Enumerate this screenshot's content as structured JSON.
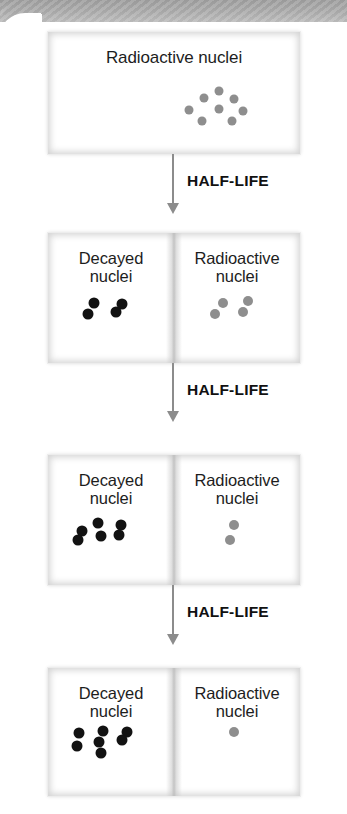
{
  "figure": {
    "colors": {
      "radioactive_nucleus": "#8e8e8e",
      "decayed_nucleus": "#121212",
      "arrow": "#8c8c8c",
      "top_band": "#a8a8a8",
      "label_text": "#1d1d1d"
    }
  },
  "labels": {
    "radioactive": "Radioactive nuclei",
    "radioactive_wrapped": "Radioactive\nnuclei",
    "decayed_wrapped": "Decayed\nnuclei",
    "half_life": "HALF-LIFE"
  },
  "stages": [
    {
      "id": "stage-0",
      "name": "initial-sample",
      "panels": [
        {
          "kind": "radioactive",
          "label": "Radioactive nuclei",
          "count": 8,
          "dot_color": "#8e8e8e",
          "dots": [
            {
              "x": 47,
              "y": 14
            },
            {
              "x": 31,
              "y": 24
            },
            {
              "x": 63,
              "y": 25
            },
            {
              "x": 16,
              "y": 40
            },
            {
              "x": 47,
              "y": 39
            },
            {
              "x": 72,
              "y": 41
            },
            {
              "x": 29,
              "y": 55
            },
            {
              "x": 60,
              "y": 55
            }
          ]
        }
      ]
    },
    {
      "id": "stage-1",
      "name": "after-one-half-life",
      "half_lives_elapsed": 1,
      "panels": [
        {
          "kind": "decayed",
          "label": "Decayed\nnuclei",
          "count": 4,
          "dot_color": "#121212",
          "dots": [
            {
              "x": 33,
              "y": 16
            },
            {
              "x": 62,
              "y": 18
            },
            {
              "x": 27,
              "y": 38
            },
            {
              "x": 56,
              "y": 34
            }
          ]
        },
        {
          "kind": "radioactive",
          "label": "Radioactive\nnuclei",
          "count": 4,
          "dot_color": "#8e8e8e",
          "dots": [
            {
              "x": 36,
              "y": 16
            },
            {
              "x": 63,
              "y": 14
            },
            {
              "x": 28,
              "y": 38
            },
            {
              "x": 57,
              "y": 33
            }
          ]
        }
      ]
    },
    {
      "id": "stage-2",
      "name": "after-two-half-lives",
      "half_lives_elapsed": 2,
      "panels": [
        {
          "kind": "decayed",
          "label": "Decayed\nnuclei",
          "count": 6,
          "dot_color": "#121212",
          "dots": [
            {
              "x": 42,
              "y": 14
            },
            {
              "x": 66,
              "y": 16
            },
            {
              "x": 25,
              "y": 28
            },
            {
              "x": 45,
              "y": 38
            },
            {
              "x": 64,
              "y": 35
            },
            {
              "x": 21,
              "y": 44
            }
          ]
        },
        {
          "kind": "radioactive",
          "label": "Radioactive\nnuclei",
          "count": 2,
          "dot_color": "#8e8e8e",
          "dots": [
            {
              "x": 48,
              "y": 17
            },
            {
              "x": 44,
              "y": 44
            }
          ]
        }
      ]
    },
    {
      "id": "stage-3",
      "name": "after-three-half-lives",
      "half_lives_elapsed": 3,
      "panels": [
        {
          "kind": "decayed",
          "label": "Decayed\nnuclei",
          "count": 7,
          "dot_color": "#121212",
          "dots": [
            {
              "x": 22,
              "y": 14
            },
            {
              "x": 47,
              "y": 10
            },
            {
              "x": 72,
              "y": 12
            },
            {
              "x": 43,
              "y": 30
            },
            {
              "x": 67,
              "y": 27
            },
            {
              "x": 20,
              "y": 37
            },
            {
              "x": 45,
              "y": 51
            }
          ]
        },
        {
          "kind": "radioactive",
          "label": "Radioactive\nnuclei",
          "count": 1,
          "dot_color": "#8e8e8e",
          "dots": [
            {
              "x": 48,
              "y": 13
            }
          ]
        }
      ]
    }
  ],
  "transitions": [
    {
      "id": "transition-1",
      "label": "HALF-LIFE"
    },
    {
      "id": "transition-2",
      "label": "HALF-LIFE"
    },
    {
      "id": "transition-3",
      "label": "HALF-LIFE"
    }
  ]
}
